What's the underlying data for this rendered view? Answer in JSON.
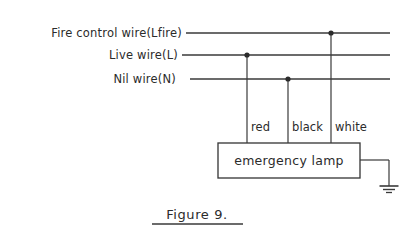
{
  "figure": {
    "caption": "Figure 9.",
    "background_color": "#ffffff",
    "ink_color": "#3a3a3a"
  },
  "bus_wires": [
    {
      "id": "fire-control",
      "label": "Fire control wire(Lfire)",
      "y": 33,
      "x_start": 186,
      "x_end": 390,
      "label_anchor_x": 182,
      "junction_x": 331,
      "has_junction": true
    },
    {
      "id": "live",
      "label": "Live wire(L)",
      "y": 55,
      "x_start": 182,
      "x_end": 390,
      "label_anchor_x": 178,
      "junction_x": 247,
      "has_junction": true
    },
    {
      "id": "nil",
      "label": "Nil wire(N)",
      "y": 79,
      "x_start": 190,
      "x_end": 390,
      "label_anchor_x": 176,
      "junction_x": 288,
      "has_junction": true
    }
  ],
  "drop_wires": [
    {
      "id": "red",
      "color_label": "red",
      "x": 247,
      "y_top": 55,
      "y_bottom": 143,
      "label_x": 251,
      "label_y": 131
    },
    {
      "id": "black",
      "color_label": "black",
      "x": 288,
      "y_top": 79,
      "y_bottom": 143,
      "label_x": 292,
      "label_y": 131
    },
    {
      "id": "white",
      "color_label": "white",
      "x": 331,
      "y_top": 33,
      "y_bottom": 143,
      "label_x": 335,
      "label_y": 131
    }
  ],
  "lamp": {
    "label": "emergency lamp",
    "x": 218,
    "y": 143,
    "width": 142,
    "height": 35,
    "label_center_x": 289,
    "label_baseline_y": 165
  },
  "ground": {
    "lead_from_x": 360,
    "lead_y": 160,
    "corner_x": 389,
    "stem_bottom_y": 186,
    "bars": [
      {
        "half_width": 9.5,
        "y": 186,
        "stroke_width": 1.6
      },
      {
        "half_width": 6,
        "y": 189.5,
        "stroke_width": 1.4
      },
      {
        "half_width": 3,
        "y": 192.5,
        "stroke_width": 1.3
      }
    ]
  },
  "caption_rule": {
    "x_start": 152,
    "x_end": 243,
    "y": 224
  },
  "caption_text": {
    "x": 197,
    "y": 219
  }
}
